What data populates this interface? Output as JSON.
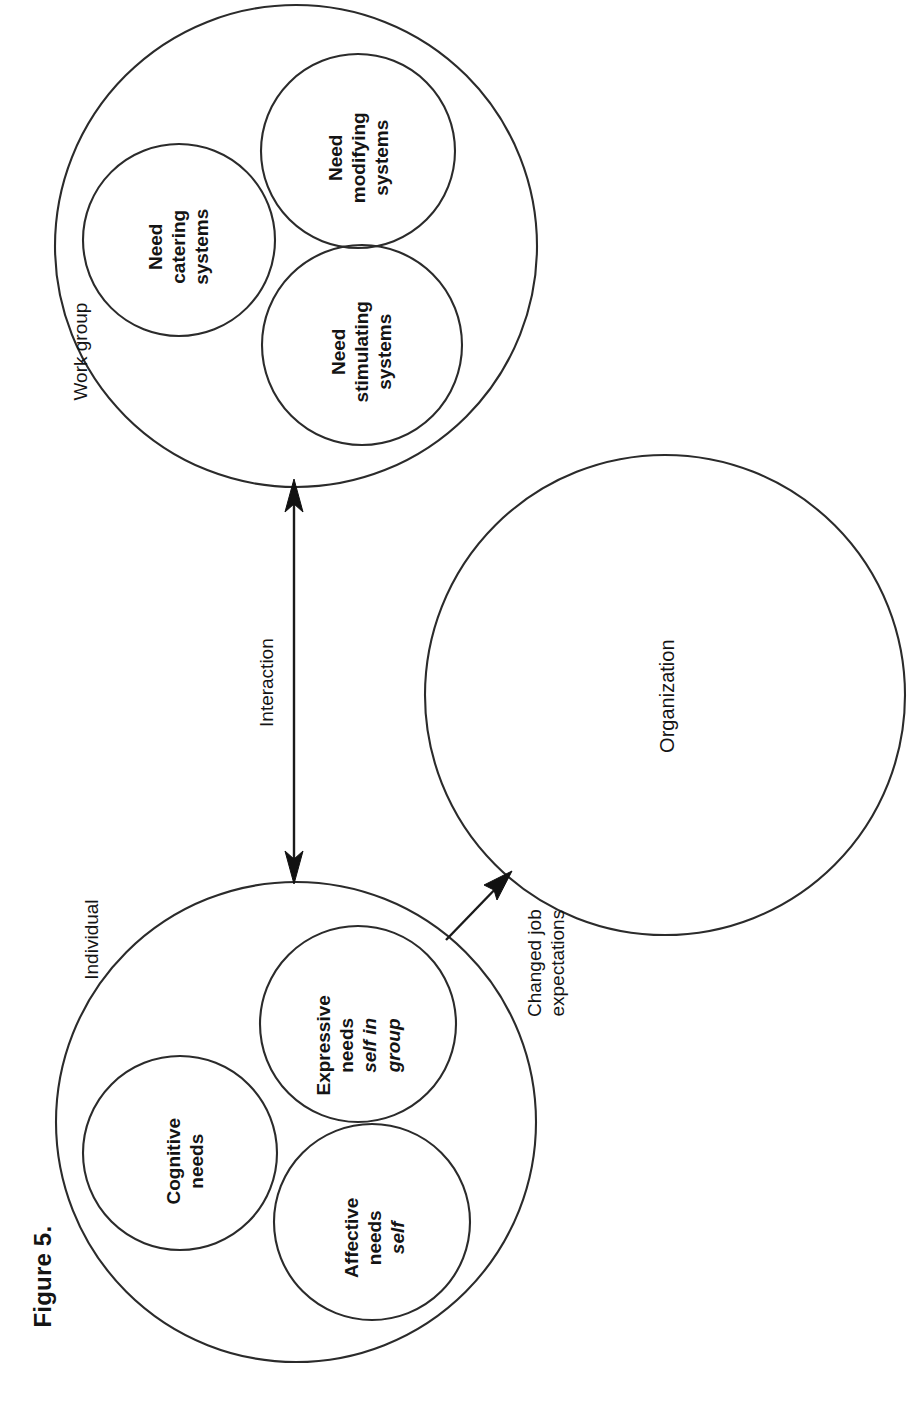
{
  "figure": {
    "caption": "Figure 5.",
    "background_color": "#ffffff",
    "line_color": "#2b2b2b",
    "text_color": "#141414",
    "orientation": "rotated-90-ccw"
  },
  "work_group": {
    "label": "Work group",
    "inner_circles": [
      {
        "line1": "Need",
        "line2": "catering",
        "line3": "systems"
      },
      {
        "line1": "Need",
        "line2": "modifying",
        "line3": "systems"
      },
      {
        "line1": "Need",
        "line2": "stimulating",
        "line3": "systems"
      }
    ]
  },
  "individual": {
    "label": "Individual",
    "inner_circles": [
      {
        "line1": "Cognitive",
        "line2": "needs",
        "line3": "",
        "line4": ""
      },
      {
        "line1": "Expressive",
        "line2": "needs",
        "line3": "self in",
        "line4": "group"
      },
      {
        "line1": "Affective",
        "line2": "needs",
        "line3": "self",
        "line4": ""
      }
    ]
  },
  "organization": {
    "label": "Organization"
  },
  "connectors": {
    "interaction": {
      "label": "Interaction",
      "type": "double-headed-arrow",
      "from": "Individual",
      "to": "Work group"
    },
    "changed_job_expectations": {
      "line1": "Changed job",
      "line2": "expectations",
      "type": "single-headed-arrow",
      "from": "Individual",
      "to": "Organization"
    }
  }
}
